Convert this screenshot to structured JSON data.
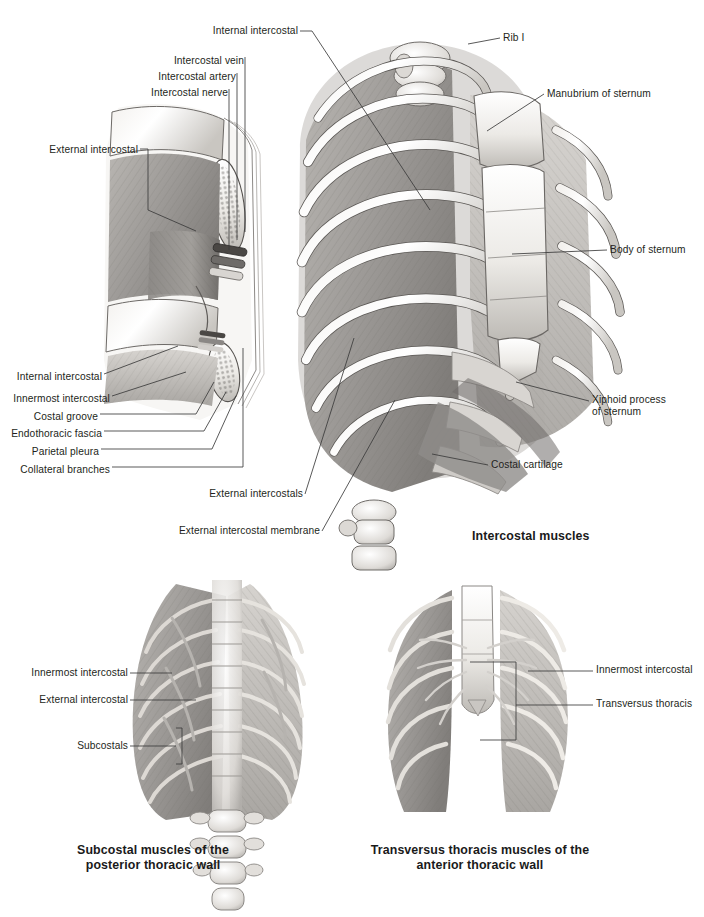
{
  "page": {
    "background": "#ffffff",
    "text_color": "#231f20",
    "leader_color": "#3b3b3b",
    "title_plate": "Intercostal muscles plate"
  },
  "figures": [
    {
      "id": "cross-section",
      "name": "intercostal-space-cross-section",
      "caption": "",
      "labels": [
        {
          "text": "External intercostal",
          "align": "right",
          "x": 20,
          "y": 150
        },
        {
          "text": "Intercostal nerve",
          "align": "right",
          "x": 150,
          "y": 93
        },
        {
          "text": "Intercostal artery",
          "align": "right",
          "x": 150,
          "y": 77
        },
        {
          "text": "Intercostal vein",
          "align": "right",
          "x": 150,
          "y": 61
        },
        {
          "text": "Internal intercostal",
          "align": "right",
          "x": 10,
          "y": 377
        },
        {
          "text": "Innermost intercostal",
          "align": "right",
          "x": 10,
          "y": 399
        },
        {
          "text": "Costal  groove",
          "align": "right",
          "x": 10,
          "y": 417
        },
        {
          "text": "Endothoracic fascia",
          "align": "right",
          "x": 10,
          "y": 434
        },
        {
          "text": "Parietal pleura",
          "align": "right",
          "x": 10,
          "y": 452
        },
        {
          "text": "Collateral branches",
          "align": "right",
          "x": 10,
          "y": 470
        }
      ]
    },
    {
      "id": "ribcage-main",
      "name": "intercostal-muscles-ribcage",
      "caption": "Intercostal muscles",
      "caption_x": 472,
      "caption_y": 529,
      "labels": [
        {
          "text": "Internal intercostal",
          "align": "right",
          "x": 225,
          "y": 31
        },
        {
          "text": "Rib I",
          "align": "left",
          "x": 503,
          "y": 38
        },
        {
          "text": "Manubrium of sternum",
          "align": "left",
          "x": 547,
          "y": 94
        },
        {
          "text": "Body of sternum",
          "align": "left",
          "x": 610,
          "y": 250
        },
        {
          "text": "Xiphoid process",
          "align": "left",
          "x": 592,
          "y": 400
        },
        {
          "text": "of sternum",
          "align": "left",
          "x": 592,
          "y": 412
        },
        {
          "text": "Costal cartilage",
          "align": "left",
          "x": 491,
          "y": 465
        },
        {
          "text": "External intercostals",
          "align": "right",
          "x": 200,
          "y": 497
        },
        {
          "text": "External intercostal membrane",
          "align": "right",
          "x": 190,
          "y": 534
        }
      ]
    },
    {
      "id": "posterior-wall",
      "name": "subcostal-muscles-posterior-thoracic-wall",
      "caption_line1": "Subcostal muscles of the",
      "caption_line2": "posterior thoracic wall",
      "caption_x": 68,
      "caption_y": 846,
      "labels": [
        {
          "text": "Innermost intercostal",
          "align": "right",
          "x": 30,
          "y": 672
        },
        {
          "text": "External intercostal",
          "align": "right",
          "x": 36,
          "y": 699
        },
        {
          "text": "Subcostals",
          "align": "right",
          "x": 72,
          "y": 745
        }
      ]
    },
    {
      "id": "anterior-wall",
      "name": "transversus-thoracis-muscles-anterior-thoracic-wall",
      "caption_line1": "Transversus thoracis muscles of the",
      "caption_line2": "anterior thoracic wall",
      "caption_x": 374,
      "caption_y": 846,
      "labels": [
        {
          "text": "Innermost intercostal",
          "align": "left",
          "x": 596,
          "y": 670
        },
        {
          "text": "Transversus thoracis",
          "align": "left",
          "x": 596,
          "y": 704
        }
      ]
    }
  ]
}
